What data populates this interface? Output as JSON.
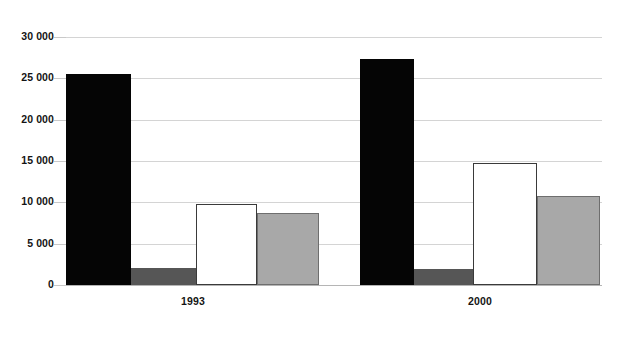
{
  "chart_data": {
    "type": "bar",
    "title": "",
    "subtitle": "",
    "xlabel": "",
    "ylabel": "",
    "categories": [
      "1993",
      "2000"
    ],
    "ylim": [
      0,
      30000
    ],
    "ytick_values": [
      30000,
      25000,
      20000,
      15000,
      10000,
      5000,
      0
    ],
    "ytick_labels": [
      "30 000",
      "25 000",
      "20 000",
      "15 000",
      "10 000",
      "5 000",
      "0"
    ],
    "grid": true,
    "legend": "none",
    "series": [
      {
        "name": "series-1",
        "color": "#050505",
        "values": [
          25500,
          27400
        ]
      },
      {
        "name": "series-2",
        "color": "#565656",
        "values": [
          2100,
          1900
        ]
      },
      {
        "name": "series-3",
        "color": "#ffffff",
        "values": [
          9800,
          14700
        ]
      },
      {
        "name": "series-4",
        "color": "#a8a8a8",
        "values": [
          8700,
          10800
        ]
      }
    ]
  },
  "axes": {
    "y_labels": [
      {
        "text": "30 000",
        "value": 30000
      },
      {
        "text": "25 000",
        "value": 25000
      },
      {
        "text": "20 000",
        "value": 20000
      },
      {
        "text": "15 000",
        "value": 15000
      },
      {
        "text": "10 000",
        "value": 10000
      },
      {
        "text": "5 000",
        "value": 5000
      },
      {
        "text": "0",
        "value": 0
      }
    ],
    "x_labels": [
      {
        "text": "1993"
      },
      {
        "text": "2000"
      }
    ]
  },
  "colors": {
    "gridline": "#d4d4d4",
    "baseline": "#b5b5b5",
    "text": "#141414",
    "background": "#ffffff"
  }
}
